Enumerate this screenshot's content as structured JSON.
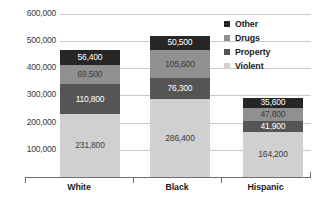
{
  "chart_data": {
    "type": "bar",
    "subtype": "stacked-vertical",
    "title": "",
    "xlabel": "",
    "ylabel": "",
    "categories": [
      "White",
      "Black",
      "Hispanic"
    ],
    "series": [
      {
        "name": "Violent",
        "color": "#d0d0d0",
        "values": [
          231800,
          286400,
          164200
        ]
      },
      {
        "name": "Property",
        "color": "#555555",
        "values": [
          110800,
          76300,
          41900
        ]
      },
      {
        "name": "Drugs",
        "color": "#909090",
        "values": [
          69500,
          105600,
          47800
        ]
      },
      {
        "name": "Other",
        "color": "#262626",
        "values": [
          56400,
          50500,
          35600
        ]
      }
    ],
    "stack_order_bottom_to_top": [
      "Violent",
      "Property",
      "Drugs",
      "Other"
    ],
    "totals": [
      468500,
      518800,
      289500
    ],
    "ylim": [
      0,
      600000
    ],
    "ytick_values": [
      100000,
      200000,
      300000,
      400000,
      500000,
      600000
    ],
    "ytick_labels": [
      "100,000",
      "200,000",
      "300,000",
      "400,000",
      "500,000",
      "600,000"
    ],
    "grid": true,
    "legend_position": "top-right",
    "legend_entries": [
      "Other",
      "Drugs",
      "Property",
      "Violent"
    ],
    "data_labels": {
      "White": {
        "Other": "56,400",
        "Drugs": "69,500",
        "Property": "110,800",
        "Violent": "231,800"
      },
      "Black": {
        "Other": "50,500",
        "Drugs": "105,600",
        "Property": "76,300",
        "Violent": "286,400"
      },
      "Hispanic": {
        "Other": "35,600",
        "Drugs": "47,800",
        "Property": "41,900",
        "Violent": "164,200"
      }
    }
  }
}
